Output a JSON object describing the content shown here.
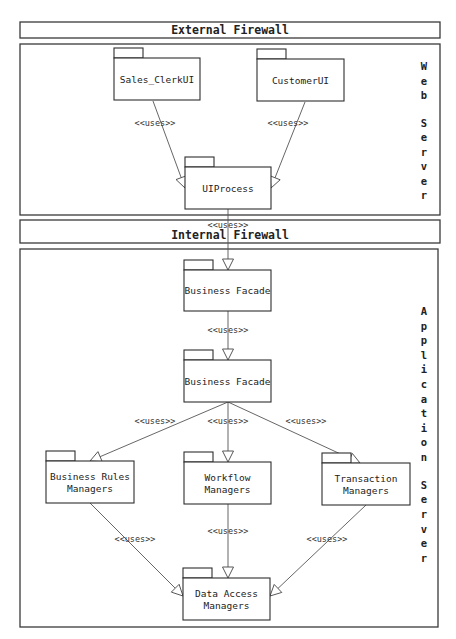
{
  "diagram": {
    "type": "uml-package-diagram",
    "firewalls": [
      {
        "id": "external",
        "label": "External Firewall"
      },
      {
        "id": "internal",
        "label": "Internal Firewall"
      }
    ],
    "tiers": [
      {
        "id": "web",
        "label": "Web Server"
      },
      {
        "id": "app",
        "label": "Application Server"
      }
    ],
    "packages": [
      {
        "id": "sales_clerk_ui",
        "tier": "web",
        "lines": [
          "Sales_ClerkUI"
        ]
      },
      {
        "id": "customer_ui",
        "tier": "web",
        "lines": [
          "CustomerUI"
        ]
      },
      {
        "id": "ui_process",
        "tier": "web",
        "lines": [
          "UIProcess"
        ]
      },
      {
        "id": "business_facade_1",
        "tier": "app",
        "lines": [
          "Business Facade"
        ]
      },
      {
        "id": "business_facade_2",
        "tier": "app",
        "lines": [
          "Business Facade"
        ]
      },
      {
        "id": "business_rules",
        "tier": "app",
        "lines": [
          "Business Rules",
          "Managers"
        ]
      },
      {
        "id": "workflow",
        "tier": "app",
        "lines": [
          "Workflow",
          "Managers"
        ]
      },
      {
        "id": "transaction",
        "tier": "app",
        "lines": [
          "Transaction",
          "Managers"
        ]
      },
      {
        "id": "data_access",
        "tier": "app",
        "lines": [
          "Data Access",
          "Managers"
        ]
      }
    ],
    "dependencies": [
      {
        "from": "sales_clerk_ui",
        "to": "ui_process",
        "label": "<<uses>>"
      },
      {
        "from": "customer_ui",
        "to": "ui_process",
        "label": "<<uses>>"
      },
      {
        "from": "ui_process",
        "to": "business_facade_1",
        "label": "<<uses>>"
      },
      {
        "from": "business_facade_1",
        "to": "business_facade_2",
        "label": "<<uses>>"
      },
      {
        "from": "business_facade_2",
        "to": "business_rules",
        "label": "<<uses>>"
      },
      {
        "from": "business_facade_2",
        "to": "workflow",
        "label": "<<uses>>"
      },
      {
        "from": "business_facade_2",
        "to": "transaction",
        "label": "<<uses>>"
      },
      {
        "from": "business_rules",
        "to": "data_access",
        "label": "<<uses>>"
      },
      {
        "from": "workflow",
        "to": "data_access",
        "label": "<<uses>>"
      },
      {
        "from": "transaction",
        "to": "data_access",
        "label": "<<uses>>"
      }
    ]
  }
}
